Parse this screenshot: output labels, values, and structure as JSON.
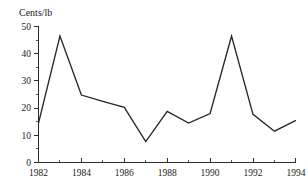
{
  "chart_data": {
    "type": "line",
    "title": "",
    "subtitle": "",
    "xlabel": "",
    "ylabel": "Cents/lb",
    "ylabel_position": "top-left",
    "x": [
      1982,
      1983,
      1984,
      1985,
      1986,
      1987,
      1988,
      1989,
      1990,
      1991,
      1992,
      1993,
      1994
    ],
    "values": [
      14.5,
      46.5,
      24.8,
      22.5,
      20.3,
      7.7,
      18.8,
      14.5,
      18.0,
      46.5,
      17.7,
      11.5,
      15.5
    ],
    "series": [
      {
        "name": "Price",
        "values": [
          14.5,
          46.5,
          24.8,
          22.5,
          20.3,
          7.7,
          18.8,
          14.5,
          18.0,
          46.5,
          17.7,
          11.5,
          15.5
        ],
        "color": "#262626"
      }
    ],
    "xlim": [
      1982,
      1994
    ],
    "ylim": [
      0,
      50
    ],
    "ytick_values": [
      0,
      10,
      20,
      30,
      40,
      50
    ],
    "ytick_labels": [
      "0",
      "10",
      "20",
      "30",
      "40",
      "50"
    ],
    "xtick_values": [
      1982,
      1984,
      1986,
      1988,
      1990,
      1992,
      1994
    ],
    "xtick_labels": [
      "1982",
      "1984",
      "1986",
      "1988",
      "1990",
      "1992",
      "1994"
    ],
    "xtick_minor_values": [
      1983,
      1985,
      1987,
      1989,
      1991,
      1993
    ],
    "ytick_minor_values": [
      5,
      15,
      25,
      35,
      45
    ],
    "grid": false,
    "legend": false,
    "legend_position": "none",
    "annotations": [],
    "axis_color": "#2b2b2b",
    "background_color": "#ffffff"
  },
  "labels": {
    "y_axis_title": "Cents/lb"
  }
}
